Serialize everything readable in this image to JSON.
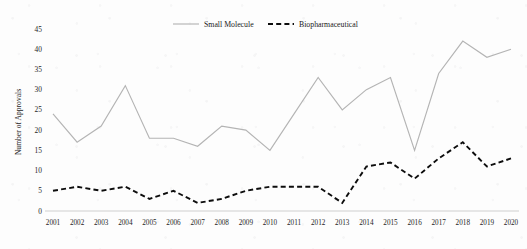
{
  "chart_data": {
    "type": "line",
    "title": "",
    "xlabel": "",
    "ylabel": "Number of Approvals",
    "categories": [
      "2001",
      "2002",
      "2003",
      "2004",
      "2005",
      "2006",
      "2007",
      "2008",
      "2009",
      "2010",
      "2011",
      "2012",
      "2013",
      "2014",
      "2015",
      "2016",
      "2017",
      "2018",
      "2019",
      "2020"
    ],
    "series": [
      {
        "name": "Small Molecule",
        "style": "solid",
        "color": "#b4b4b4",
        "values": [
          24,
          17,
          21,
          31,
          18,
          18,
          16,
          21,
          20,
          15,
          24,
          33,
          25,
          30,
          33,
          15,
          34,
          42,
          38,
          40
        ]
      },
      {
        "name": "Biopharmaceutical",
        "style": "dashed",
        "color": "#0d0d0d",
        "values": [
          5,
          6,
          5,
          6,
          3,
          5,
          2,
          3,
          5,
          6,
          6,
          6,
          2,
          11,
          12,
          8,
          13,
          17,
          11,
          13
        ]
      }
    ],
    "ylim": [
      0,
      45
    ],
    "yticks": [
      0,
      5,
      10,
      15,
      20,
      25,
      30,
      35,
      40,
      45
    ],
    "ytick_labels": [
      "0",
      "5",
      "10",
      "15",
      "20",
      "25",
      "30",
      "35",
      "40",
      "45"
    ],
    "grid": false,
    "legend_position": "top-center",
    "legend": [
      "Small Molecule",
      "Biopharmaceutical"
    ]
  }
}
